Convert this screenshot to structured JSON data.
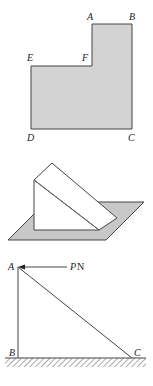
{
  "figure1": {
    "description": "L-shaped shaded region",
    "fill": "#d3d3d3",
    "stroke": "#444444",
    "labels": {
      "A": "A",
      "B": "B",
      "C": "C",
      "D": "D",
      "E": "E",
      "F": "F"
    }
  },
  "figure2": {
    "description": "Triangular wedge (prism) resting on a shaded inclined plane",
    "plane_fill": "#c8c8c8",
    "wedge_fill": "#ffffff",
    "stroke": "#444444"
  },
  "figure3": {
    "description": "Right triangle ABC on hatched ground with horizontal force at A",
    "labels": {
      "A": "A",
      "B": "B",
      "C": "C",
      "force_symbol": "P",
      "force_unit": "N"
    },
    "stroke": "#444444"
  }
}
